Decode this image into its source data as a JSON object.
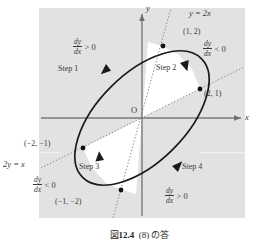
{
  "figure": {
    "caption": {
      "prefix": "図",
      "number": "12.4",
      "text": "(8) の答"
    },
    "panel": {
      "background_color": "#e2e2e2",
      "white_sector_color": "#ffffff"
    },
    "axes": {
      "x_label": "x",
      "y_label": "y",
      "origin_label": "O",
      "axis_color": "#7a7a7a"
    },
    "curve": {
      "type": "ellipse",
      "color": "#1a1a1a",
      "rotation_deg": 45,
      "description": "tilted closed orbit tangent to the two dotted lines"
    },
    "dotted_lines": [
      {
        "label": "y = 2x",
        "slope": 2,
        "color": "#8a8a8a"
      },
      {
        "label": "2y = x",
        "slope": 0.5,
        "color": "#8a8a8a"
      }
    ],
    "points": [
      {
        "label": "(1, 2)",
        "x": 1,
        "y": 2
      },
      {
        "label": "(2, 1)",
        "x": 2,
        "y": 1
      },
      {
        "label": "(−2, −1)",
        "x": -2,
        "y": -1
      },
      {
        "label": "(−1, −2)",
        "x": -1,
        "y": -2
      }
    ],
    "steps": [
      {
        "label": "Step 1",
        "derivative_num": "dy",
        "derivative_den": "dx",
        "relation": "> 0"
      },
      {
        "label": "Step 2",
        "derivative_num": "dy",
        "derivative_den": "dx",
        "relation": "< 0"
      },
      {
        "label": "Step 3",
        "derivative_num": "dy",
        "derivative_den": "dx",
        "relation": "< 0"
      },
      {
        "label": "Step 4",
        "derivative_num": "dy",
        "derivative_den": "dx",
        "relation": "> 0"
      }
    ]
  }
}
